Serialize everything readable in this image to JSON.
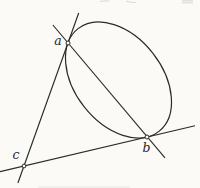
{
  "figure": {
    "background": "#fbfaf7",
    "ink_color": "#2b2b2b",
    "description_labels": {
      "a": "a",
      "b": "b",
      "c": "c"
    },
    "ellipse": {
      "cx": 118.5,
      "cy": 80,
      "rx": 65.4,
      "ry": 43.6,
      "transform": "rotate(51.8 118.5 80)"
    },
    "lines": {
      "tangent_ca": {
        "x1": 78.7,
        "y1": 13,
        "x2": 17.9,
        "y2": 183
      },
      "tangent_cb": {
        "x1": 0,
        "y1": 171.7,
        "x2": 195,
        "y2": 125.7
      },
      "chord_ab": {
        "x1": 52.9,
        "y1": 25,
        "x2": 165,
        "y2": 157.8
      }
    },
    "points": {
      "a": {
        "x": 68,
        "y": 43,
        "r": 2,
        "label_x": 58,
        "label_y": 45
      },
      "b": {
        "x": 147,
        "y": 137,
        "r": 2,
        "label_x": 146.5,
        "label_y": 152
      },
      "c": {
        "x": 24,
        "y": 166,
        "r": 1.9,
        "label_x": 16,
        "label_y": 159
      }
    },
    "artifacts": {
      "color": "#bcbcb6",
      "top_mark_1_d": "M100,1.5 q4.5,-1.2 9,-0.4",
      "top_mark_2_d": "M126,1 q5,1.8 10,1.4",
      "top_mark_3_d": "M182,0.8 h11 M182,2.8 h11",
      "bottom_smudge_d": "M38,187 h92",
      "bottom_smudge_color": "#dcdcd6"
    }
  }
}
